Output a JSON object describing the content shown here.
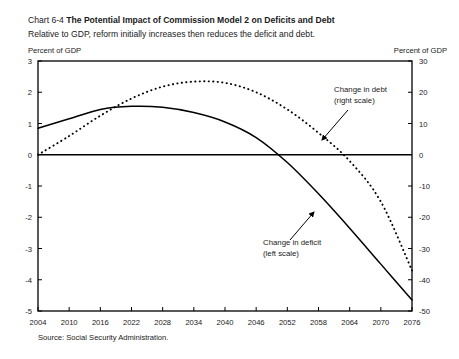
{
  "header": {
    "chart_number": "Chart 6-4",
    "title": "The Potential Impact of Commission Model 2 on Deficits and Debt",
    "subtitle": "Relative to GDP, reform initially increases then reduces the deficit and debt."
  },
  "axis_captions": {
    "left": "Percent of GDP",
    "right": "Percent of GDP"
  },
  "source": "Source: Social Security Administration.",
  "chart_data": {
    "type": "line",
    "title": "Chart 6-4 The Potential Impact of Commission Model 2 on Deficits and Debt",
    "subtitle": "Relative to GDP, reform initially increases then reduces the deficit and debt.",
    "xlabel": "",
    "ylabel": "Percent of GDP",
    "ylabel_right": "Percent of GDP",
    "xlim": [
      2004,
      2076
    ],
    "ylim": [
      -5,
      3
    ],
    "ylim_right": [
      -50,
      30
    ],
    "grid": false,
    "legend": "annotations",
    "xticks": [
      2004,
      2010,
      2016,
      2022,
      2028,
      2034,
      2040,
      2046,
      2052,
      2058,
      2064,
      2070,
      2076
    ],
    "xtick_labels": [
      "2004",
      "2010",
      "2016",
      "2022",
      "2028",
      "2034",
      "2040",
      "2046",
      "2052",
      "2058",
      "2064",
      "2070",
      "2076"
    ],
    "yticks_left": [
      3,
      2,
      1,
      0,
      -1,
      -2,
      -3,
      -4,
      -5
    ],
    "ytick_labels_left": [
      "3",
      "2",
      "1",
      "0",
      "-1",
      "-2",
      "-3",
      "-4",
      "-5"
    ],
    "yticks_right": [
      30,
      20,
      10,
      0,
      -10,
      -20,
      -30,
      -40,
      -50
    ],
    "ytick_labels_right": [
      "30",
      "20",
      "10",
      "0",
      "-10",
      "-20",
      "-30",
      "-40",
      "-50"
    ],
    "series": [
      {
        "name": "Change in deficit (left scale)",
        "style": "solid",
        "axis": "left",
        "color": "#000000",
        "x": [
          2004,
          2010,
          2016,
          2022,
          2028,
          2034,
          2040,
          2046,
          2052,
          2058,
          2064,
          2070,
          2076
        ],
        "values": [
          0.85,
          1.15,
          1.45,
          1.55,
          1.52,
          1.35,
          1.05,
          0.55,
          -0.25,
          -1.25,
          -2.35,
          -3.5,
          -4.65
        ]
      },
      {
        "name": "Change in debt (right scale)",
        "style": "dotted",
        "axis": "right",
        "color": "#000000",
        "x": [
          2004,
          2010,
          2016,
          2022,
          2028,
          2034,
          2040,
          2046,
          2052,
          2058,
          2064,
          2070,
          2076
        ],
        "values": [
          0.0,
          6.0,
          12.5,
          18.0,
          21.8,
          23.4,
          23.0,
          20.0,
          14.5,
          7.0,
          -2.0,
          -15.0,
          -37.0
        ]
      }
    ],
    "annotations": [
      {
        "id": "debt-annotation",
        "lines": [
          "Change in debt",
          "(right scale)"
        ],
        "text_x": 334,
        "text_y": 92,
        "arrow_from": [
          348,
          110
        ],
        "arrow_to": [
          322,
          140
        ]
      },
      {
        "id": "deficit-annotation",
        "lines": [
          "Change in deficit",
          "(left scale)"
        ],
        "text_x": 263,
        "text_y": 245,
        "arrow_from": [
          290,
          240
        ],
        "arrow_to": [
          314,
          212
        ]
      }
    ]
  }
}
